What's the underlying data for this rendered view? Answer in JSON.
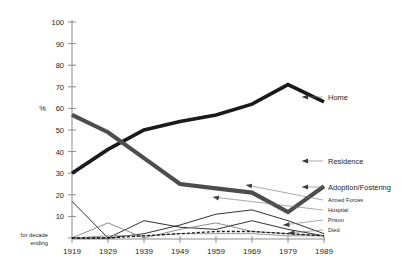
{
  "chart_data": {
    "type": "line",
    "title": "",
    "xlabel": "for decade ending",
    "ylabel": "%",
    "ylim": [
      0,
      100
    ],
    "xlim": [
      1919,
      1989
    ],
    "grid": false,
    "legend_position": "right-inline-labels",
    "categories": [
      "1919",
      "1929",
      "1939",
      "1949",
      "1959",
      "1969",
      "1979",
      "1989"
    ],
    "yticks": [
      "0",
      "10",
      "20",
      "30",
      "40",
      "50",
      "60",
      "70",
      "80",
      "90",
      "100"
    ],
    "series": [
      {
        "name": "Home",
        "style": "thick-black",
        "color": "#1a1a1a",
        "values": [
          30,
          41,
          50,
          54,
          57,
          62,
          71,
          63
        ]
      },
      {
        "name": "Residence",
        "style": "thick-gray",
        "color": "#4d4d4d",
        "values": [
          57,
          49,
          37,
          25,
          23,
          21,
          12,
          24
        ]
      },
      {
        "name": "Adoption/Fostering",
        "style": "thin-black",
        "color": "#1a1a1a",
        "values": [
          0,
          0,
          2,
          6,
          11,
          13,
          8,
          2
        ]
      },
      {
        "name": "Armed Forces",
        "style": "thin-black",
        "color": "#1a1a1a",
        "values": [
          17,
          0,
          8,
          5,
          4,
          8,
          4,
          1
        ]
      },
      {
        "name": "Hospital",
        "style": "thin-gray",
        "color": "#808080",
        "values": [
          0,
          7,
          0,
          4,
          7,
          3,
          2,
          1
        ]
      },
      {
        "name": "Prison",
        "style": "thin-gray",
        "color": "#8c8c8c",
        "values": [
          0,
          1,
          1,
          2,
          2,
          2,
          1,
          1
        ]
      },
      {
        "name": "Died",
        "style": "dashed-black",
        "color": "#1a1a1a",
        "values": [
          0,
          0,
          1,
          2,
          3,
          3,
          2,
          1
        ]
      }
    ]
  },
  "axis": {
    "unit_label": "%",
    "corner_note_line1": "for decade",
    "corner_note_line2": "ending"
  },
  "labels": {
    "home": "Home",
    "residence": "Residence",
    "adoption": "Adoption/Fostering",
    "armed_forces": "Armed Forces",
    "hospital": "Hospital",
    "prison": "Prison",
    "died": "Died"
  }
}
